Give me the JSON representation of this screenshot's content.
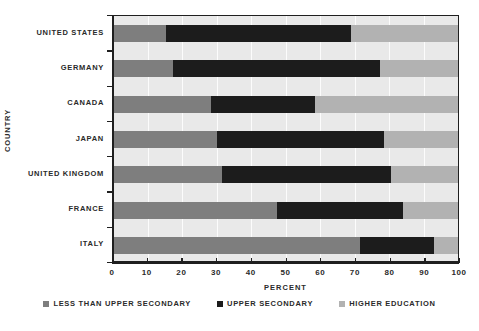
{
  "chart_data": {
    "type": "bar",
    "orientation": "horizontal",
    "stacked": true,
    "title": "",
    "xlabel": "Percent",
    "ylabel": "Country",
    "xlim": [
      0,
      100
    ],
    "xticks": [
      0,
      10,
      20,
      30,
      40,
      50,
      60,
      70,
      80,
      90,
      100
    ],
    "xticklabels": [
      "0",
      "10",
      "20",
      "30",
      "40",
      "50",
      "60",
      "70",
      "80",
      "90",
      "100"
    ],
    "grid": true,
    "legend_position": "bottom",
    "categories": [
      "United States",
      "Germany",
      "Canada",
      "Japan",
      "United Kingdom",
      "France",
      "Italy"
    ],
    "series": [
      {
        "name": "Less than Upper Secondary",
        "color": "#7e7e7e",
        "values": [
          15.5,
          17.5,
          28.5,
          30.0,
          31.5,
          47.5,
          71.5
        ]
      },
      {
        "name": "Upper Secondary",
        "color": "#1c1c1c",
        "values": [
          53.5,
          60.0,
          30.0,
          48.5,
          49.0,
          36.5,
          21.5
        ]
      },
      {
        "name": "Higher Education",
        "color": "#b2b2b2",
        "values": [
          31.0,
          22.5,
          41.5,
          21.5,
          19.5,
          16.0,
          7.0
        ]
      }
    ],
    "legend": [
      {
        "label": "Less than Upper Secondary",
        "color": "#7e7e7e"
      },
      {
        "label": "Upper Secondary",
        "color": "#1c1c1c"
      },
      {
        "label": "Higher Education",
        "color": "#b2b2b2"
      }
    ]
  }
}
